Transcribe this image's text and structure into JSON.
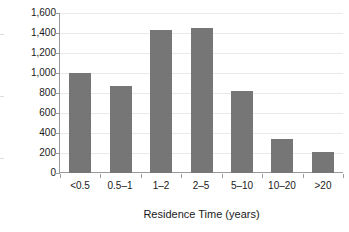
{
  "chart_data": {
    "type": "bar",
    "title": "",
    "subtitle": "",
    "xlabel": "Residence Time (years)",
    "ylabel": "Population (millions)",
    "categories": [
      "<0.5",
      "0.5–1",
      "1–2",
      "2–5",
      "5–10",
      "10–20",
      ">20"
    ],
    "values": [
      1000,
      870,
      1430,
      1450,
      815,
      340,
      205
    ],
    "ylim": [
      0,
      1600
    ],
    "ytick_values": [
      0,
      200,
      400,
      600,
      800,
      1000,
      1200,
      1400,
      1600
    ],
    "ytick_labels": [
      "0",
      "200",
      "400",
      "600",
      "800",
      "1,000",
      "1,200",
      "1,400",
      "1,600"
    ],
    "grid": true,
    "legend": false,
    "legend_position": "none",
    "bar_color": "#767676",
    "axis_color": "#9a9a9a",
    "gridline_color": "#e9e9e9",
    "background_color": "#ffffff"
  }
}
